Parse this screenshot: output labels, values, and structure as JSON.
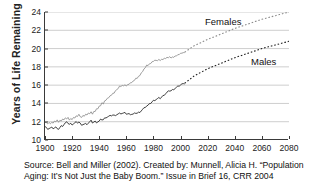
{
  "chart_data": {
    "type": "line",
    "title": "",
    "xlabel": "",
    "ylabel": "Years of Life Remaining",
    "xlim": [
      1900,
      2080
    ],
    "ylim": [
      10,
      24
    ],
    "xticks": [
      1900,
      1920,
      1940,
      1960,
      1980,
      2000,
      2020,
      2040,
      2060,
      2080
    ],
    "yticks": [
      10,
      12,
      14,
      16,
      18,
      20,
      22,
      24
    ],
    "grid": "horizontal",
    "legend_position": "inline-annotations",
    "historical_projection_split_year": 2003,
    "series": [
      {
        "name": "Females",
        "label": "Females",
        "color": "#8c8c8c",
        "historical_style": "solid",
        "projection_style": "dotted",
        "x": [
          1900,
          1905,
          1910,
          1915,
          1920,
          1925,
          1930,
          1935,
          1940,
          1945,
          1950,
          1955,
          1960,
          1965,
          1970,
          1975,
          1980,
          1985,
          1990,
          1995,
          2000,
          2003,
          2010,
          2020,
          2030,
          2040,
          2050,
          2060,
          2070,
          2080
        ],
        "values": [
          12.0,
          11.9,
          12.1,
          12.3,
          12.3,
          12.6,
          12.8,
          13.0,
          13.6,
          14.4,
          15.0,
          15.9,
          16.0,
          16.4,
          17.1,
          18.1,
          18.6,
          18.8,
          19.0,
          19.1,
          19.4,
          19.6,
          20.3,
          21.0,
          21.6,
          22.2,
          22.7,
          23.2,
          23.6,
          24.0
        ]
      },
      {
        "name": "Males",
        "label": "Males",
        "color": "#1f1f1f",
        "historical_style": "solid",
        "projection_style": "dotted",
        "x": [
          1900,
          1905,
          1910,
          1915,
          1920,
          1925,
          1930,
          1935,
          1940,
          1945,
          1950,
          1955,
          1960,
          1965,
          1970,
          1975,
          1980,
          1985,
          1990,
          1995,
          2000,
          2003,
          2010,
          2020,
          2030,
          2040,
          2050,
          2060,
          2070,
          2080
        ],
        "values": [
          11.4,
          11.3,
          11.3,
          11.8,
          11.8,
          11.9,
          11.7,
          12.0,
          12.0,
          12.5,
          12.7,
          12.9,
          12.9,
          12.8,
          13.1,
          13.7,
          14.3,
          14.6,
          15.2,
          15.6,
          16.0,
          16.2,
          17.0,
          17.8,
          18.4,
          19.0,
          19.5,
          20.0,
          20.4,
          20.8
        ]
      }
    ],
    "annotations": [
      {
        "text": "Females",
        "near_x": 2020,
        "near_y": 22.6
      },
      {
        "text": "Males",
        "near_x": 2055,
        "near_y": 19.6
      }
    ]
  },
  "caption": {
    "line1": "Source: Bell and Miller (2002).  Created by: Munnell, Alicia H.  “Population",
    "line2": "Aging: It’s Not Just the Baby Boom.”  Issue in Brief 16,  CRR 2004"
  }
}
